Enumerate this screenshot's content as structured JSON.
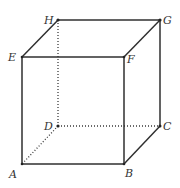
{
  "diagram": {
    "type": "cube",
    "title": "",
    "colors": {
      "edge": "#2f2f2f",
      "hidden_edge": "#3a3a3a",
      "label": "#333333",
      "background": "#ffffff"
    },
    "vertices": {
      "A": {
        "label": "A",
        "x": 22,
        "y": 164
      },
      "B": {
        "label": "B",
        "x": 124,
        "y": 164
      },
      "C": {
        "label": "C",
        "x": 160,
        "y": 126
      },
      "D": {
        "label": "D",
        "x": 58,
        "y": 126
      },
      "E": {
        "label": "E",
        "x": 22,
        "y": 57
      },
      "F": {
        "label": "F",
        "x": 124,
        "y": 57
      },
      "G": {
        "label": "G",
        "x": 160,
        "y": 20
      },
      "H": {
        "label": "H",
        "x": 58,
        "y": 20
      }
    },
    "solid_edges": [
      [
        "A",
        "B"
      ],
      [
        "B",
        "F"
      ],
      [
        "F",
        "E"
      ],
      [
        "E",
        "A"
      ],
      [
        "E",
        "H"
      ],
      [
        "H",
        "G"
      ],
      [
        "G",
        "F"
      ],
      [
        "G",
        "C"
      ],
      [
        "C",
        "B"
      ]
    ],
    "hidden_edges": [
      [
        "D",
        "A"
      ],
      [
        "D",
        "C"
      ],
      [
        "D",
        "H"
      ]
    ]
  }
}
